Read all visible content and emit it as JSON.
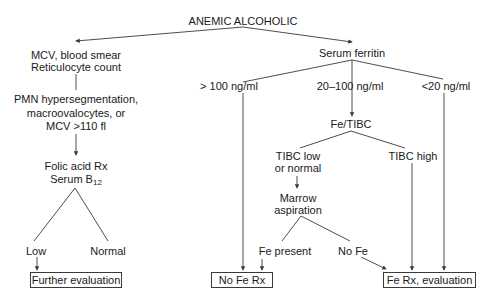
{
  "diagram": {
    "root": "ANEMIC ALCOHOLIC",
    "left_branch": {
      "step1_line1": "MCV, blood smear",
      "step1_line2": "Reticulocyte count",
      "step2_line1": "PMN hypersegmentation,",
      "step2_line2": "macroovalocytes, or",
      "step2_line3": "MCV >110 fl",
      "step3_line1": "Folic acid Rx",
      "step3_line2_prefix": "Serum B",
      "step3_line2_sub": "12",
      "outcome_low": "Low",
      "outcome_normal": "Normal",
      "result_box": "Further evaluation"
    },
    "right_branch": {
      "step1": "Serum ferritin",
      "range_high": "> 100 ng/ml",
      "range_mid": "20–100 ng/ml",
      "range_low": "<20 ng/ml",
      "fe_tibc": "Fe/TIBC",
      "tibc_low_line1": "TIBC low",
      "tibc_low_line2": "or normal",
      "tibc_high": "TIBC high",
      "marrow_line1": "Marrow",
      "marrow_line2": "aspiration",
      "fe_present": "Fe present",
      "no_fe": "No Fe",
      "result_no_fe_rx": "No Fe Rx",
      "result_fe_rx": "Fe Rx, evaluation"
    },
    "colors": {
      "line": "#3a3a3a",
      "text": "#1a1a1a",
      "background": "#ffffff"
    }
  }
}
